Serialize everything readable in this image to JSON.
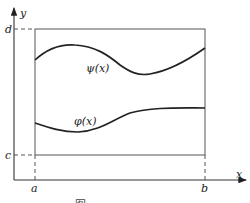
{
  "diagram": {
    "type": "region between curves",
    "axes": {
      "x_label": "x",
      "y_label": "y"
    },
    "bounds": {
      "left_label": "a",
      "right_label": "b",
      "top_label": "d",
      "bottom_label": "c"
    },
    "curves": [
      {
        "name": "upper",
        "label": "ψ(x)"
      },
      {
        "name": "lower",
        "label": "φ(x)"
      }
    ],
    "colors": {
      "ink": "#222222",
      "frame": "#555555",
      "background": "#ffffff"
    },
    "caption": "图"
  }
}
